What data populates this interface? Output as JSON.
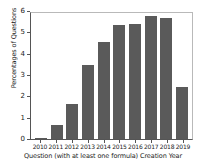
{
  "chart_data": {
    "type": "bar",
    "title": "",
    "xlabel": "Question (with at least one formula) Creation Year",
    "ylabel": "Percentages of Questions",
    "categories": [
      "2010",
      "2011",
      "2012",
      "2013",
      "2014",
      "2015",
      "2016",
      "2017",
      "2018",
      "2019"
    ],
    "values": [
      0.05,
      0.65,
      1.65,
      3.45,
      4.55,
      5.35,
      5.38,
      5.78,
      5.65,
      2.45
    ],
    "ylim": [
      0,
      6
    ],
    "yticks": [
      0,
      1,
      2,
      3,
      4,
      5,
      6
    ],
    "ytick_labels": [
      "0",
      "1",
      "2",
      "3",
      "4",
      "5",
      "6"
    ],
    "grid": false,
    "legend": null,
    "bar_color": "#5a5a5a",
    "axis_color": "#555555"
  }
}
